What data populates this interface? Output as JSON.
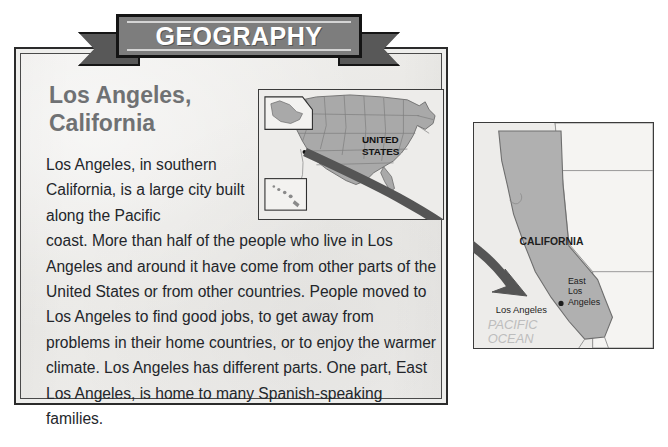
{
  "banner": {
    "title": "GEOGRAPHY"
  },
  "article": {
    "title_line1": "Los Angeles,",
    "title_line2": "California",
    "paragraph_narrow": "    Los Angeles, in southern California, is a large city built along the Pacific",
    "paragraph_wide": "coast. More than half of the people who live in Los Angeles and around it have come from other parts of the United States or from other countries. People moved to Los Angeles to find good jobs, to get away from problems in their home countries, or to enjoy the warmer climate. Los Angeles has different parts. One part, East Los Angeles, is home to many Spanish-speaking families.",
    "full_text": "Los Angeles, in southern California, is a large city built along the Pacific coast. More than half of the people who live in Los Angeles and around it have come from other parts of the United States or from other countries. People moved to Los Angeles to find good jobs, to get away from problems in their home countries, or to enjoy the warmer climate. Los Angeles has different parts. One part, East Los Angeles, is home to many Spanish-speaking families."
  },
  "map_us": {
    "label_line1": "UNITED",
    "label_line2": "STATES",
    "inset_alaska": "alaska-inset",
    "inset_hawaii": "hawaii-inset",
    "city_dot": "los-angeles-dot"
  },
  "map_ca": {
    "state_label": "CALIFORNIA",
    "city_label": "Los Angeles",
    "district_label_line1": "East",
    "district_label_line2": "Los",
    "district_label_line3": "Angeles",
    "ocean_label_line1": "PACIFIC",
    "ocean_label_line2": "OCEAN"
  },
  "colors": {
    "paper": "#eeeeec",
    "banner_fill": "#7d7d7d",
    "banner_tail": "#585858",
    "banner_border": "#141414",
    "heading_gray": "#6f7173",
    "body_text": "#23262b",
    "land_gray": "#a8a8a8",
    "land_light": "#f2f1ef",
    "arrow_gray": "#595959",
    "ocean_text": "#b9b9b9"
  }
}
